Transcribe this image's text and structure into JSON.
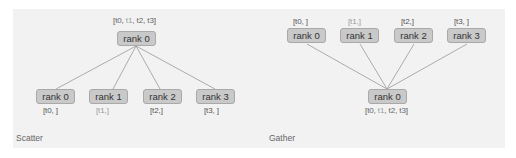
{
  "scatter": {
    "caption": "Scatter",
    "root": {
      "label": "rank 0",
      "data": [
        "[",
        "t0",
        ", ",
        "t1",
        ", ",
        "t2",
        ", ",
        "t3",
        "]"
      ]
    },
    "children": [
      {
        "label": "rank 0",
        "data": "[t0, ]"
      },
      {
        "label": "rank 1",
        "data": "[t1,]"
      },
      {
        "label": "rank 2",
        "data": "[t2,]"
      },
      {
        "label": "rank 3",
        "data": "[t3, ]"
      }
    ]
  },
  "gather": {
    "caption": "Gather",
    "sources": [
      {
        "label": "rank 0",
        "data": "[t0, ]"
      },
      {
        "label": "rank 1",
        "data": "[t1,]"
      },
      {
        "label": "rank 2",
        "data": "[t2,]"
      },
      {
        "label": "rank 3",
        "data": "[t3, ]"
      }
    ],
    "root": {
      "label": "rank 0",
      "data": [
        "[",
        "t0",
        ", ",
        "t1",
        ", ",
        "t2",
        ", ",
        "t3",
        "]"
      ]
    }
  },
  "colors": {
    "panel_bg": "#f2f2f2",
    "box_fill": "#c9c9c9",
    "box_border": "#a9a9a9",
    "edge": "#999999",
    "t1_text": "#9a9a9a"
  }
}
